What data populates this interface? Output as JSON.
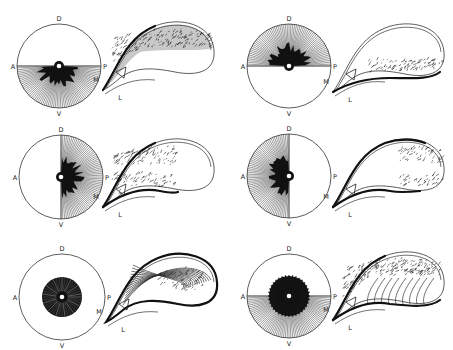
{
  "figure": {
    "panels": [
      {
        "id": "top-left",
        "retina": {
          "labels": {
            "dorsal": "D",
            "anterior": "A",
            "posterior": "P",
            "ventral": "V"
          },
          "filled_region": "ventral-half"
        },
        "tectum": {
          "labels": {
            "medial": "M",
            "lateral": "L"
          },
          "marker": "triangle",
          "projection_region": "medial-band"
        }
      },
      {
        "id": "top-right",
        "retina": {
          "labels": {
            "dorsal": "D",
            "anterior": "A",
            "posterior": "P",
            "ventral": "V"
          },
          "filled_region": "dorsal-half"
        },
        "tectum": {
          "labels": {
            "medial": "M",
            "lateral": "L"
          },
          "marker": "triangle",
          "projection_region": "lateral-band"
        }
      },
      {
        "id": "middle-left",
        "retina": {
          "labels": {
            "dorsal": "D",
            "anterior": "A",
            "posterior": "P",
            "ventral": "V"
          },
          "filled_region": "posterior-half"
        },
        "tectum": {
          "labels": {
            "medial": "M",
            "lateral": "L"
          },
          "marker": "triangle",
          "projection_region": "rostral-half"
        }
      },
      {
        "id": "middle-right",
        "retina": {
          "labels": {
            "dorsal": "D",
            "anterior": "A",
            "posterior": "P",
            "ventral": "V"
          },
          "filled_region": "anterior-half"
        },
        "tectum": {
          "labels": {
            "medial": "M",
            "lateral": "L"
          },
          "marker": "triangle",
          "projection_region": "caudal-half"
        }
      },
      {
        "id": "bottom-left",
        "retina": {
          "labels": {
            "dorsal": "D",
            "anterior": "A",
            "posterior": "P",
            "ventral": "V"
          },
          "filled_region": "central-disc"
        },
        "tectum": {
          "labels": {
            "medial": "M",
            "lateral": "L"
          },
          "marker": "triangle",
          "projection_region": "central-with-fibers"
        }
      },
      {
        "id": "bottom-right",
        "retina": {
          "labels": {
            "dorsal": "D",
            "anterior": "A",
            "posterior": "P",
            "ventral": "V"
          },
          "filled_region": "central-disc-plus-ventral-half"
        },
        "tectum": {
          "labels": {
            "medial": "M",
            "lateral": "L"
          },
          "marker": "triangle",
          "projection_region": "medial-with-fibers"
        }
      }
    ]
  }
}
